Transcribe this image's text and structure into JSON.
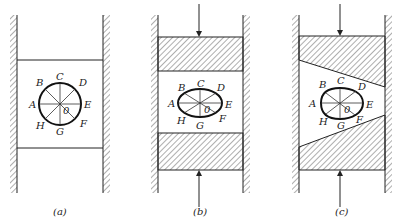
{
  "figure": {
    "panels": [
      {
        "caption": "(a)",
        "description": "Undeformed state: circle between walls, no load",
        "points": {
          "A": "A",
          "B": "B",
          "C": "C",
          "D": "D",
          "E": "E",
          "F": "F",
          "G": "G",
          "H": "H",
          "O": "0"
        }
      },
      {
        "caption": "(b)",
        "description": "Uniform compression by parallel hatched blocks, circle becomes ellipse",
        "points": {
          "A": "A",
          "B": "B",
          "C": "C",
          "D": "D",
          "E": "E",
          "F": "F",
          "G": "G",
          "H": "H",
          "O": "0"
        }
      },
      {
        "caption": "(c)",
        "description": "Compression by wedge-shaped blocks, circle becomes egg shape",
        "points": {
          "A": "A",
          "B": "B",
          "C": "C",
          "D": "D",
          "E": "E",
          "F": "F",
          "G": "G",
          "H": "H",
          "O": "0"
        }
      }
    ],
    "colors": {
      "ink": "#222222",
      "background": "#ffffff"
    }
  }
}
